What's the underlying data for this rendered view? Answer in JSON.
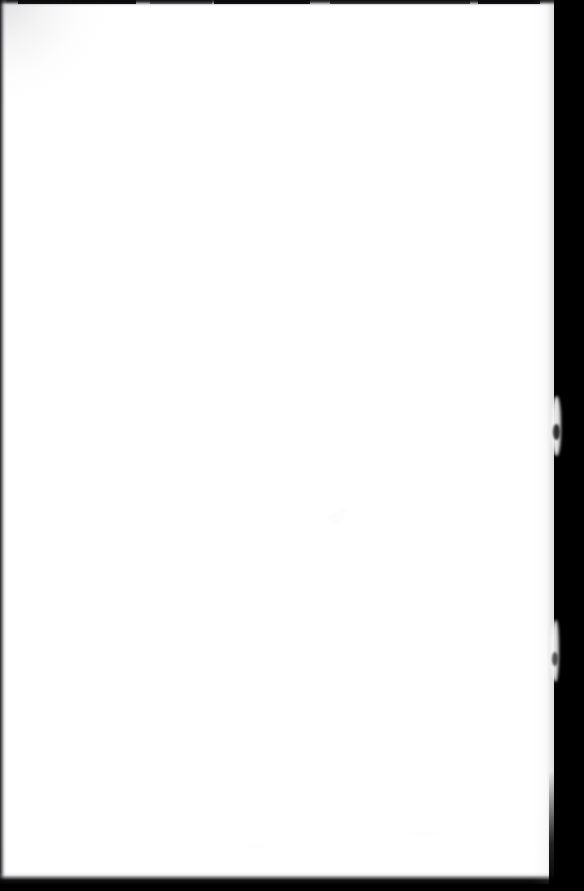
{
  "document": {
    "kind": "scanned-page-image",
    "page_content_text": "",
    "is_blank": true,
    "visible_text_count": 0
  },
  "scan": {
    "canvas_width_px": 584,
    "canvas_height_px": 891,
    "background_color": "#000000",
    "paper_color": "#ffffff",
    "edge_shadow_color": "#0a0a0c",
    "paper_left_px": 0,
    "paper_top_px": 0,
    "paper_width_px": 559,
    "paper_height_px": 884
  },
  "regions": {
    "paper_surface": "blank-paper-surface",
    "top_edge": "top-trimmed-edge-shadow",
    "left_edge": "left-trimmed-edge-shadow",
    "bottom_edge": "bottom-trimmed-edge-shadow",
    "right_gutter": "scanner-background-gutter"
  },
  "artifacts": [
    {
      "name": "corner-vignette-top-left",
      "x": 0,
      "y": 0,
      "w": 120,
      "h": 110
    },
    {
      "name": "paper-speck-center",
      "x": 328,
      "y": 512,
      "w": 16,
      "h": 12
    },
    {
      "name": "paper-speck-center-small",
      "x": 338,
      "y": 508,
      "w": 9,
      "h": 6
    },
    {
      "name": "paper-smudge-lower",
      "x": 408,
      "y": 830,
      "w": 30,
      "h": 8
    },
    {
      "name": "paper-smudge-foot",
      "x": 246,
      "y": 842,
      "w": 26,
      "h": 7
    },
    {
      "name": "edge-bulge-upper",
      "x": 552,
      "y": 396,
      "w": 9,
      "h": 60
    },
    {
      "name": "edge-bulge-lower",
      "x": 551,
      "y": 620,
      "w": 8,
      "h": 62
    }
  ]
}
